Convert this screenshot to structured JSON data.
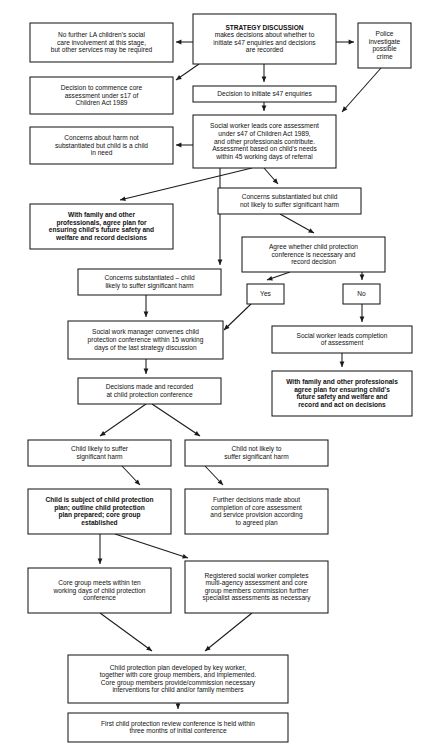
{
  "diagram": {
    "background_color": "#ffffff",
    "line_color": "#1a1a1a",
    "text_color": "#111111"
  },
  "nodes": {
    "no_further_involvement": {
      "id": "no-further-involvement",
      "bold": false,
      "lines": [
        "No further LA children's social",
        "care involvement at this stage,",
        "but other services may be required"
      ]
    },
    "strategy_discussion": {
      "id": "strategy-discussion",
      "bold": false,
      "lines": [
        "STRATEGY DISCUSSION",
        "makes decisions about whether to",
        "initiate s47 enquiries and decisions",
        "are recorded"
      ],
      "bold_lines": [
        0
      ]
    },
    "police_investigate": {
      "id": "police-investigate",
      "bold": false,
      "lines": [
        "Police",
        "investigate",
        "possible",
        "crime"
      ]
    },
    "decision_commence_core": {
      "id": "decision-commence-core-assessment",
      "bold": false,
      "lines": [
        "Decision to commence core",
        "assessment under s17 of",
        "Children Act 1989"
      ]
    },
    "decision_initiate_s47": {
      "id": "decision-initiate-s47-enquiries",
      "bold": false,
      "lines": [
        "Decision to initiate s47 enquiries"
      ]
    },
    "concerns_not_substantiated": {
      "id": "concerns-not-substantiated-child-in-need",
      "bold": false,
      "lines": [
        "Concerns about harm not",
        "substantiated but child is a child",
        "in need"
      ]
    },
    "social_worker_leads_core": {
      "id": "social-worker-leads-core-assessment",
      "bold": false,
      "lines": [
        "Social worker leads core assessment",
        "under s47 of Children Act 1989,",
        "and other professionals contribute.",
        "Assessment based on child's needs",
        "within 45 working days of referral"
      ]
    },
    "with_family_agree_plan_left": {
      "id": "with-family-agree-plan-left",
      "bold": true,
      "lines": [
        "With family and other",
        "professionals, agree plan for",
        "ensuring child's future safety and",
        "welfare and record decisions"
      ]
    },
    "concerns_substantiated_not_likely": {
      "id": "concerns-substantiated-not-likely-significant-harm",
      "bold": false,
      "lines": [
        "Concerns substantiated but child",
        "not likely to suffer significant harm"
      ]
    },
    "agree_whether_conference": {
      "id": "agree-whether-conference-necessary",
      "bold": false,
      "lines": [
        "Agree whether child protection",
        "conference is necessary and",
        "record decision"
      ]
    },
    "concerns_substantiated_likely": {
      "id": "concerns-substantiated-likely-significant-harm",
      "bold": false,
      "lines": [
        "Concerns substantiated – child",
        "likely to suffer significant harm"
      ]
    },
    "yes": {
      "id": "decision-yes",
      "bold": false,
      "lines": [
        "Yes"
      ]
    },
    "no": {
      "id": "decision-no",
      "bold": false,
      "lines": [
        "No"
      ]
    },
    "manager_convenes_conference": {
      "id": "social-work-manager-convenes-conference",
      "bold": false,
      "lines": [
        "Social work manager convenes child",
        "protection conference within 15 working",
        "days of the last strategy discussion"
      ]
    },
    "social_worker_completion": {
      "id": "social-worker-leads-completion-of-assessment",
      "bold": false,
      "lines": [
        "Social worker leads completion",
        "of assessment"
      ]
    },
    "decisions_made_recorded": {
      "id": "decisions-made-and-recorded-at-conference",
      "bold": false,
      "lines": [
        "Decisions made and recorded",
        "at child protection conference"
      ]
    },
    "with_family_agree_plan_right": {
      "id": "with-family-agree-plan-right",
      "bold": true,
      "lines": [
        "With family and other professionals",
        "agree plan for ensuring child's",
        "future safety and welfare and",
        "record and act on decisions"
      ]
    },
    "child_likely_suffer": {
      "id": "child-likely-to-suffer-significant-harm",
      "bold": false,
      "lines": [
        "Child likely to suffer",
        "significant harm"
      ]
    },
    "child_not_likely_suffer": {
      "id": "child-not-likely-to-suffer-significant-harm",
      "bold": false,
      "lines": [
        "Child not likely to",
        "suffer significant harm"
      ]
    },
    "child_subject_cp_plan": {
      "id": "child-subject-of-child-protection-plan",
      "bold": true,
      "lines": [
        "Child is subject of child protection",
        "plan; outline child protection",
        "plan prepared; core group",
        "established"
      ]
    },
    "further_decisions": {
      "id": "further-decisions-core-assessment",
      "bold": false,
      "lines": [
        "Further decisions made about",
        "completion of core assessment",
        "and service provision according",
        "to agreed plan"
      ]
    },
    "core_group_meets": {
      "id": "core-group-meets-within-ten-working-days",
      "bold": false,
      "lines": [
        "Core group meets within ten",
        "working days of child protection",
        "conference"
      ]
    },
    "registered_sw_completes": {
      "id": "registered-social-worker-completes-assessment",
      "bold": false,
      "lines": [
        "Registered social worker completes",
        "multi-agency assessment and core",
        "group members commission further",
        "specialist assessments as necessary"
      ]
    },
    "cp_plan_developed": {
      "id": "child-protection-plan-developed-by-key-worker",
      "bold": false,
      "lines": [
        "Child protection plan developed by key worker,",
        "together with core group members, and implemented.",
        "Core group members provide/commission necessary",
        "interventions for child and/or family members"
      ]
    },
    "first_review_conference": {
      "id": "first-child-protection-review-conference",
      "bold": false,
      "lines": [
        "First child protection review conference is held within",
        "three months of initial conference"
      ]
    }
  },
  "layout": {
    "nodes": [
      {
        "key": "no_further_involvement",
        "x": 30,
        "y": 23,
        "w": 143,
        "h": 39
      },
      {
        "key": "strategy_discussion",
        "x": 193,
        "y": 14,
        "w": 143,
        "h": 50
      },
      {
        "key": "police_investigate",
        "x": 358,
        "y": 23,
        "w": 53,
        "h": 45
      },
      {
        "key": "decision_commence_core",
        "x": 30,
        "y": 77,
        "w": 143,
        "h": 37
      },
      {
        "key": "decision_initiate_s47",
        "x": 193,
        "y": 86,
        "w": 143,
        "h": 16
      },
      {
        "key": "concerns_not_substantiated",
        "x": 30,
        "y": 127,
        "w": 143,
        "h": 37
      },
      {
        "key": "social_worker_leads_core",
        "x": 193,
        "y": 115,
        "w": 143,
        "h": 53
      },
      {
        "key": "with_family_agree_plan_left",
        "x": 30,
        "y": 204,
        "w": 143,
        "h": 45
      },
      {
        "key": "concerns_substantiated_not_likely",
        "x": 218,
        "y": 188,
        "w": 143,
        "h": 26
      },
      {
        "key": "agree_whether_conference",
        "x": 242,
        "y": 237,
        "w": 143,
        "h": 35
      },
      {
        "key": "concerns_substantiated_likely",
        "x": 78,
        "y": 269,
        "w": 143,
        "h": 26
      },
      {
        "key": "yes",
        "x": 247,
        "y": 284,
        "w": 37,
        "h": 20
      },
      {
        "key": "no",
        "x": 343,
        "y": 284,
        "w": 37,
        "h": 20
      },
      {
        "key": "manager_convenes_conference",
        "x": 68,
        "y": 321,
        "w": 155,
        "h": 38
      },
      {
        "key": "social_worker_completion",
        "x": 272,
        "y": 326,
        "w": 140,
        "h": 27
      },
      {
        "key": "decisions_made_recorded",
        "x": 78,
        "y": 378,
        "w": 143,
        "h": 26
      },
      {
        "key": "with_family_agree_plan_right",
        "x": 272,
        "y": 371,
        "w": 140,
        "h": 45
      },
      {
        "key": "child_likely_suffer",
        "x": 28,
        "y": 440,
        "w": 143,
        "h": 26
      },
      {
        "key": "child_not_likely_suffer",
        "x": 185,
        "y": 440,
        "w": 143,
        "h": 26
      },
      {
        "key": "child_subject_cp_plan",
        "x": 28,
        "y": 489,
        "w": 143,
        "h": 45
      },
      {
        "key": "further_decisions",
        "x": 185,
        "y": 489,
        "w": 143,
        "h": 45
      },
      {
        "key": "core_group_meets",
        "x": 28,
        "y": 568,
        "w": 143,
        "h": 45
      },
      {
        "key": "registered_sw_completes",
        "x": 185,
        "y": 561,
        "w": 143,
        "h": 52
      },
      {
        "key": "cp_plan_developed",
        "x": 68,
        "y": 655,
        "w": 220,
        "h": 48
      },
      {
        "key": "first_review_conference",
        "x": 68,
        "y": 713,
        "w": 220,
        "h": 29
      }
    ],
    "edges": [
      {
        "name": "strategy-to-no-further",
        "points": [
          [
            193,
            42
          ],
          [
            176,
            42
          ]
        ],
        "arrow": "end"
      },
      {
        "name": "strategy-to-police",
        "points": [
          [
            336,
            42
          ],
          [
            354,
            42
          ]
        ],
        "arrow": "end"
      },
      {
        "name": "strategy-to-commence-core",
        "points": [
          [
            199,
            64
          ],
          [
            176,
            80
          ]
        ],
        "arrow": "end"
      },
      {
        "name": "strategy-to-initiate-s47",
        "points": [
          [
            264,
            64
          ],
          [
            264,
            82
          ]
        ],
        "arrow": "end"
      },
      {
        "name": "initiate-s47-to-core-assessment",
        "points": [
          [
            264,
            102
          ],
          [
            264,
            111
          ]
        ],
        "arrow": "end"
      },
      {
        "name": "police-to-core-assessment",
        "points": [
          [
            381,
            68
          ],
          [
            342,
            112
          ]
        ],
        "arrow": "end"
      },
      {
        "name": "core-assessment-to-not-substantiated",
        "points": [
          [
            193,
            145
          ],
          [
            176,
            145
          ]
        ],
        "arrow": "end"
      },
      {
        "name": "core-assessment-to-agree-plan",
        "points": [
          [
            252,
            168
          ],
          [
            120,
            200
          ]
        ],
        "arrow": "end"
      },
      {
        "name": "core-assessment-to-concerns-not-likely",
        "points": [
          [
            264,
            168
          ],
          [
            278,
            184
          ]
        ],
        "arrow": "end"
      },
      {
        "name": "core-assessment-to-concerns-likely",
        "points": [
          [
            220,
            168
          ],
          [
            220,
            265
          ]
        ],
        "arrow": "end"
      },
      {
        "name": "concerns-not-likely-to-agree-whether",
        "points": [
          [
            280,
            214
          ],
          [
            314,
            233
          ]
        ],
        "arrow": "end"
      },
      {
        "name": "agree-whether-to-yes",
        "points": [
          [
            290,
            272
          ],
          [
            267,
            280
          ]
        ],
        "arrow": "end"
      },
      {
        "name": "agree-whether-to-no",
        "points": [
          [
            362,
            272
          ],
          [
            362,
            280
          ]
        ],
        "arrow": "end"
      },
      {
        "name": "concerns-likely-to-manager",
        "points": [
          [
            146,
            295
          ],
          [
            146,
            317
          ]
        ],
        "arrow": "end"
      },
      {
        "name": "yes-to-manager",
        "points": [
          [
            251,
            304
          ],
          [
            224,
            330
          ]
        ],
        "arrow": "end"
      },
      {
        "name": "no-to-completion",
        "points": [
          [
            362,
            304
          ],
          [
            362,
            322
          ]
        ],
        "arrow": "end"
      },
      {
        "name": "manager-to-decisions-made",
        "points": [
          [
            146,
            359
          ],
          [
            146,
            374
          ]
        ],
        "arrow": "end"
      },
      {
        "name": "completion-to-agree-plan-right",
        "points": [
          [
            342,
            353
          ],
          [
            342,
            367
          ]
        ],
        "arrow": "end"
      },
      {
        "name": "decisions-to-child-likely",
        "points": [
          [
            146,
            404
          ],
          [
            100,
            436
          ]
        ],
        "arrow": "end"
      },
      {
        "name": "decisions-to-child-not-likely",
        "points": [
          [
            152,
            404
          ],
          [
            200,
            436
          ]
        ],
        "arrow": "end"
      },
      {
        "name": "child-likely-to-cp-plan",
        "points": [
          [
            122,
            466
          ],
          [
            140,
            485
          ]
        ],
        "arrow": "end"
      },
      {
        "name": "child-not-likely-to-further",
        "points": [
          [
            205,
            466
          ],
          [
            223,
            485
          ]
        ],
        "arrow": "end"
      },
      {
        "name": "cp-plan-to-core-group",
        "points": [
          [
            100,
            534
          ],
          [
            100,
            564
          ]
        ],
        "arrow": "end"
      },
      {
        "name": "cp-plan-to-registered-sw",
        "points": [
          [
            115,
            534
          ],
          [
            188,
            558
          ]
        ],
        "arrow": "end"
      },
      {
        "name": "core-group-to-cp-plan-developed",
        "points": [
          [
            100,
            613
          ],
          [
            152,
            651
          ]
        ],
        "arrow": "end"
      },
      {
        "name": "registered-sw-to-cp-plan-developed",
        "points": [
          [
            252,
            613
          ],
          [
            205,
            651
          ]
        ],
        "arrow": "end"
      },
      {
        "name": "cp-plan-developed-to-review",
        "points": [
          [
            178,
            703
          ],
          [
            178,
            709
          ]
        ],
        "arrow": "end"
      }
    ]
  }
}
